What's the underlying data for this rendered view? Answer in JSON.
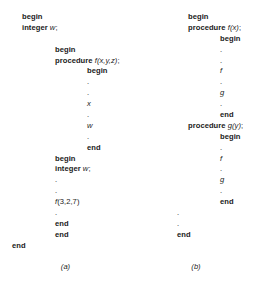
{
  "figure": {
    "panels": [
      {
        "id": "a",
        "caption": "(a)",
        "lines": [
          {
            "indent": "lv0",
            "kind": "keyword",
            "text": "begin"
          },
          {
            "indent": "lv0",
            "kind": "mixed",
            "keyword": "integer ",
            "ident": "w",
            "tail": ";"
          },
          {
            "indent": "lv0",
            "kind": "blank",
            "text": ""
          },
          {
            "indent": "lv1",
            "kind": "keyword",
            "text": "begin"
          },
          {
            "indent": "lv1",
            "kind": "mixed",
            "keyword": "procedure ",
            "ident": "f(x,y,z)",
            "tail": ";"
          },
          {
            "indent": "lv2",
            "kind": "keyword",
            "text": "begin"
          },
          {
            "indent": "lv2",
            "kind": "dot",
            "text": "."
          },
          {
            "indent": "lv2",
            "kind": "dot",
            "text": "."
          },
          {
            "indent": "lv2",
            "kind": "ident",
            "text": "x"
          },
          {
            "indent": "lv2",
            "kind": "dot",
            "text": "."
          },
          {
            "indent": "lv2",
            "kind": "ident",
            "text": "w"
          },
          {
            "indent": "lv2",
            "kind": "dot",
            "text": "."
          },
          {
            "indent": "lv2",
            "kind": "keyword",
            "text": "end"
          },
          {
            "indent": "lv1",
            "kind": "keyword",
            "text": "begin"
          },
          {
            "indent": "lv1",
            "kind": "mixed",
            "keyword": "integer ",
            "ident": "w",
            "tail": ";"
          },
          {
            "indent": "lv1",
            "kind": "dot",
            "text": "."
          },
          {
            "indent": "lv1",
            "kind": "dot",
            "text": "."
          },
          {
            "indent": "lv1",
            "kind": "call",
            "ident": "f",
            "tail": "(3,2,7)"
          },
          {
            "indent": "lv1",
            "kind": "dot",
            "text": "."
          },
          {
            "indent": "lv1",
            "kind": "keyword",
            "text": "end"
          },
          {
            "indent": "lv1",
            "kind": "keyword",
            "text": "end"
          },
          {
            "indent": "lv3",
            "kind": "keyword",
            "text": "end"
          }
        ]
      },
      {
        "id": "b",
        "caption": "(b)",
        "lines": [
          {
            "indent": "bv0",
            "kind": "keyword",
            "text": "begin"
          },
          {
            "indent": "bv0",
            "kind": "mixed",
            "keyword": "procedure ",
            "ident": "f(x)",
            "tail": ";"
          },
          {
            "indent": "bv1",
            "kind": "keyword",
            "text": "begin"
          },
          {
            "indent": "bv1",
            "kind": "dot",
            "text": "."
          },
          {
            "indent": "bv1",
            "kind": "dot",
            "text": "."
          },
          {
            "indent": "bv1",
            "kind": "ident",
            "text": "f"
          },
          {
            "indent": "bv1",
            "kind": "dot",
            "text": "."
          },
          {
            "indent": "bv1",
            "kind": "ident",
            "text": "g"
          },
          {
            "indent": "bv1",
            "kind": "dot",
            "text": "."
          },
          {
            "indent": "bv1",
            "kind": "keyword",
            "text": "end"
          },
          {
            "indent": "bv0",
            "kind": "mixed",
            "keyword": "procedure ",
            "ident": "g(y)",
            "tail": ";"
          },
          {
            "indent": "bv1",
            "kind": "keyword",
            "text": "begin"
          },
          {
            "indent": "bv1",
            "kind": "dot",
            "text": "."
          },
          {
            "indent": "bv1",
            "kind": "ident",
            "text": "f"
          },
          {
            "indent": "bv1",
            "kind": "dot",
            "text": "."
          },
          {
            "indent": "bv1",
            "kind": "ident",
            "text": "g"
          },
          {
            "indent": "bv1",
            "kind": "dot",
            "text": "."
          },
          {
            "indent": "bv1",
            "kind": "keyword",
            "text": "end"
          },
          {
            "indent": "bv2",
            "kind": "dot",
            "text": "."
          },
          {
            "indent": "bv2",
            "kind": "dot",
            "text": "."
          },
          {
            "indent": "bv2",
            "kind": "keyword",
            "text": "end"
          }
        ]
      }
    ]
  }
}
